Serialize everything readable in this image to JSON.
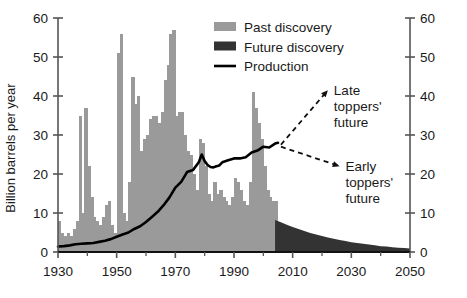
{
  "chart_data": {
    "type": "bar",
    "title": "",
    "subtitle": "",
    "xlabel": "",
    "ylabel": "Billion barrels per year",
    "ylabel_right": "",
    "xlim": [
      1930,
      2050
    ],
    "ylim": [
      0,
      60
    ],
    "grid": false,
    "x_ticks": [
      1930,
      1950,
      1970,
      1990,
      2010,
      2030,
      2050
    ],
    "x_tick_labels": [
      "1930",
      "1950",
      "1970",
      "1990",
      "2010",
      "2030",
      "2050"
    ],
    "y_ticks": [
      0,
      10,
      20,
      30,
      40,
      50,
      60
    ],
    "y_tick_labels": [
      "0",
      "10",
      "20",
      "30",
      "40",
      "50",
      "60"
    ],
    "y_ticks_right": [
      0,
      10,
      20,
      30,
      40,
      50,
      60
    ],
    "y_tick_labels_right": [
      "0",
      "10",
      "20",
      "30",
      "40",
      "50",
      "60"
    ],
    "legend_position": "top-center",
    "legend": [
      {
        "name": "Past discovery",
        "type": "bar",
        "color": "#9a9a9a"
      },
      {
        "name": "Future discovery",
        "type": "bar",
        "color": "#333333"
      },
      {
        "name": "Production",
        "type": "line",
        "color": "#000000"
      }
    ],
    "series": [
      {
        "name": "Past discovery",
        "type": "bar",
        "color": "#9a9a9a",
        "x": [
          1930,
          1931,
          1932,
          1933,
          1934,
          1935,
          1936,
          1937,
          1938,
          1939,
          1940,
          1941,
          1942,
          1943,
          1944,
          1945,
          1946,
          1947,
          1948,
          1949,
          1950,
          1951,
          1952,
          1953,
          1954,
          1955,
          1956,
          1957,
          1958,
          1959,
          1960,
          1961,
          1962,
          1963,
          1964,
          1965,
          1966,
          1967,
          1968,
          1969,
          1970,
          1971,
          1972,
          1973,
          1974,
          1975,
          1976,
          1977,
          1978,
          1979,
          1980,
          1981,
          1982,
          1983,
          1984,
          1985,
          1986,
          1987,
          1988,
          1989,
          1990,
          1991,
          1992,
          1993,
          1994,
          1995,
          1996,
          1997,
          1998,
          1999,
          2000,
          2001,
          2002,
          2003,
          2004
        ],
        "values": [
          8,
          5,
          4,
          5,
          4,
          6,
          8,
          35,
          10,
          37,
          22,
          14,
          9,
          8,
          7,
          9,
          12,
          13,
          7,
          5,
          51,
          56,
          10,
          8,
          18,
          45,
          38,
          40,
          26,
          29,
          30,
          34,
          35,
          35,
          33,
          36,
          44,
          48,
          56,
          57,
          35,
          36,
          36,
          30,
          26,
          25,
          20,
          16,
          29,
          28,
          22,
          15,
          13,
          18,
          15,
          16,
          14,
          13,
          12,
          14,
          19,
          18,
          16,
          13,
          12,
          18,
          41,
          37,
          33,
          29,
          22,
          16,
          14,
          13,
          13
        ]
      },
      {
        "name": "Future discovery",
        "type": "area",
        "color": "#333333",
        "x": [
          2004,
          2006,
          2008,
          2010,
          2012,
          2014,
          2016,
          2018,
          2020,
          2022,
          2024,
          2026,
          2028,
          2030,
          2032,
          2034,
          2036,
          2038,
          2040,
          2042,
          2044,
          2046,
          2048,
          2050
        ],
        "values": [
          8.2,
          7.6,
          7.0,
          6.4,
          5.9,
          5.4,
          4.9,
          4.5,
          4.1,
          3.7,
          3.4,
          3.1,
          2.8,
          2.5,
          2.3,
          2.1,
          1.9,
          1.7,
          1.5,
          1.4,
          1.2,
          1.1,
          1.0,
          0.9
        ]
      },
      {
        "name": "Production",
        "type": "line",
        "color": "#000000",
        "x": [
          1930,
          1932,
          1934,
          1936,
          1938,
          1940,
          1942,
          1944,
          1946,
          1948,
          1950,
          1952,
          1954,
          1956,
          1958,
          1960,
          1962,
          1964,
          1966,
          1968,
          1970,
          1972,
          1974,
          1976,
          1978,
          1979,
          1980,
          1981,
          1982,
          1983,
          1984,
          1985,
          1986,
          1988,
          1990,
          1992,
          1994,
          1996,
          1998,
          2000,
          2002,
          2004,
          2005
        ],
        "values": [
          1.4,
          1.5,
          1.7,
          2.0,
          2.1,
          2.2,
          2.3,
          2.6,
          2.9,
          3.3,
          3.9,
          4.5,
          5.0,
          5.9,
          6.6,
          7.7,
          9.0,
          10.3,
          12.0,
          14.0,
          16.5,
          18.0,
          20.5,
          21.0,
          23.0,
          25.0,
          23.3,
          22.3,
          21.8,
          21.7,
          22.0,
          22.2,
          23.0,
          23.5,
          24.0,
          24.0,
          24.3,
          25.5,
          26.0,
          27.0,
          26.8,
          27.8,
          28.0
        ]
      }
    ],
    "annotations": [
      {
        "name": "late-toppers-future",
        "lines": [
          "Late",
          "toppers'",
          "future"
        ],
        "arrow_from": [
          2006,
          27.5
        ],
        "arrow_to": [
          2022,
          41.5
        ],
        "style": "dashed-arrow"
      },
      {
        "name": "early-toppers-future",
        "lines": [
          "Early",
          "toppers'",
          "future"
        ],
        "arrow_from": [
          2006,
          27.0
        ],
        "arrow_to": [
          2026,
          22.0
        ],
        "style": "dashed-arrow"
      }
    ]
  },
  "colors": {
    "past_discovery": "#9a9a9a",
    "future_discovery": "#333333",
    "production": "#000000",
    "axis": "#555555",
    "text": "#1a1a1a",
    "background": "#ffffff"
  }
}
